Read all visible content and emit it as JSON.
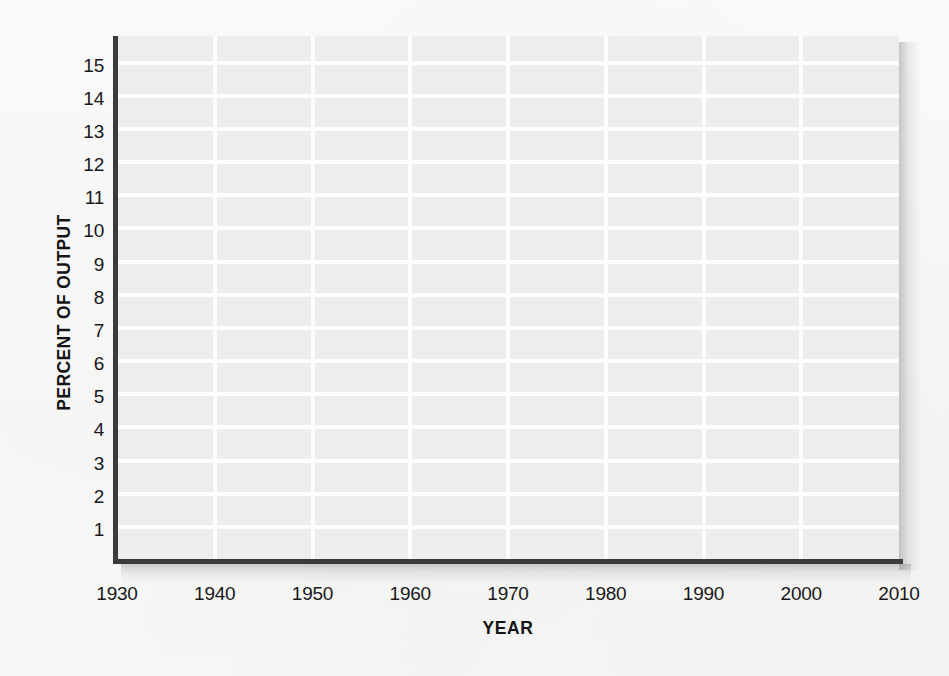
{
  "figure": {
    "background_color": "#fbfbfa",
    "panel_color": "#ededee",
    "gridline_color": "#fdfdfd",
    "axis_color": "#3b3b3d",
    "text_color": "#18181a"
  },
  "chart_data": {
    "type": "line",
    "title": "",
    "subtitle": "",
    "xlabel": "YEAR",
    "ylabel": "PERCENT OF OUTPUT",
    "xlim": [
      1930,
      2010
    ],
    "ylim": [
      0,
      15.8
    ],
    "xticks": [
      1930,
      1940,
      1950,
      1960,
      1970,
      1980,
      1990,
      2000,
      2010
    ],
    "xtick_labels": [
      "1930",
      "1940",
      "1950",
      "1960",
      "1970",
      "1980",
      "1990",
      "2000",
      "2010"
    ],
    "yticks": [
      1,
      2,
      3,
      4,
      5,
      6,
      7,
      8,
      9,
      10,
      11,
      12,
      13,
      14,
      15
    ],
    "ytick_labels": [
      "1",
      "2",
      "3",
      "4",
      "5",
      "6",
      "7",
      "8",
      "9",
      "10",
      "11",
      "12",
      "13",
      "14",
      "15"
    ],
    "grid": true,
    "grid_axis": "both",
    "legend": false,
    "legend_position": "none",
    "annotations": [],
    "series": [],
    "note": "Blank plotting grid: axes, ticks and gridlines are drawn but no data is plotted."
  }
}
